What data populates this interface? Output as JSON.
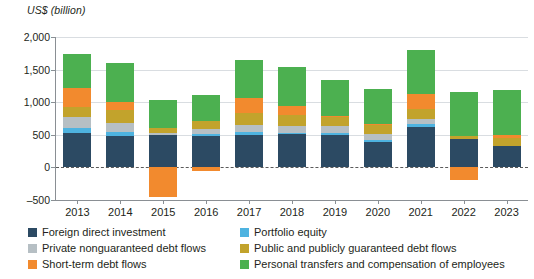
{
  "axis_title": "US$ (billion)",
  "colors": {
    "fdi": "#2c4a63",
    "portfolio_equity": "#4eb3e0",
    "private_nonguaranteed": "#b6bfc4",
    "ppg": "#c2a32c",
    "short_term": "#f28a2e",
    "personal_transfers": "#4cb050",
    "gridline": "#d9dde1",
    "axis": "#8a8f94",
    "zero_line": "#5a5a5a",
    "text": "#231f20"
  },
  "legend": {
    "items": [
      {
        "label": "Foreign direct investment",
        "color_key": "fdi",
        "swatch": "#2c4a63"
      },
      {
        "label": "Portfolio equity",
        "color_key": "portfolio_equity",
        "swatch": "#4eb3e0"
      },
      {
        "label": "Private nonguaranteed debt flows",
        "color_key": "private_nonguaranteed",
        "swatch": "#b6bfc4"
      },
      {
        "label": "Public and publicly guaranteed debt flows",
        "color_key": "ppg",
        "swatch": "#c2a32c"
      },
      {
        "label": "Short-term debt flows",
        "color_key": "short_term",
        "swatch": "#f28a2e"
      },
      {
        "label": "Personal transfers and compensation of employees",
        "color_key": "personal_transfers",
        "swatch": "#4cb050"
      }
    ]
  },
  "chart_data": {
    "type": "bar",
    "stacked": true,
    "title": "",
    "subtitle": "",
    "xlabel": "",
    "ylabel": "US$ (billion)",
    "ylim": [
      -500,
      2000
    ],
    "ytick_values": [
      -500,
      0,
      500,
      1000,
      1500,
      2000
    ],
    "ytick_labels": [
      "–500",
      "0",
      "500",
      "1,000",
      "1,500",
      "2,000"
    ],
    "grid": true,
    "legend_position": "bottom",
    "categories": [
      "2013",
      "2014",
      "2015",
      "2016",
      "2017",
      "2018",
      "2019",
      "2020",
      "2021",
      "2022",
      "2023"
    ],
    "series": [
      {
        "name": "Foreign direct investment",
        "color": "#2c4a63",
        "values": [
          530,
          480,
          495,
          475,
          500,
          505,
          500,
          395,
          615,
          440,
          335
        ]
      },
      {
        "name": "Portfolio equity",
        "color": "#4eb3e0",
        "values": [
          80,
          70,
          0,
          35,
          50,
          30,
          35,
          20,
          45,
          0,
          0
        ]
      },
      {
        "name": "Private nonguaranteed debt flows",
        "color": "#b6bfc4",
        "values": [
          165,
          125,
          40,
          75,
          95,
          105,
          105,
          90,
          85,
          0,
          0
        ]
      },
      {
        "name": "Public and publicly guaranteed debt flows",
        "color": "#c2a32c",
        "values": [
          145,
          200,
          70,
          125,
          185,
          165,
          145,
          150,
          155,
          40,
          110
        ]
      },
      {
        "name": "Short-term debt flows",
        "color": "#f28a2e",
        "values": [
          295,
          130,
          -460,
          -50,
          235,
          130,
          10,
          10,
          230,
          -195,
          50
        ]
      },
      {
        "name": "Personal transfers and compensation of employees",
        "color": "#4cb050",
        "values": [
          530,
          595,
          425,
          395,
          585,
          610,
          545,
          530,
          670,
          680,
          690
        ]
      }
    ],
    "totals_positive": [
      1745,
      1600,
      1030,
      1105,
      1650,
      1545,
      1340,
      1185,
      1800,
      1160,
      1185
    ],
    "negative_values": {
      "2015": -460,
      "2016": -50,
      "2022": -195
    }
  }
}
